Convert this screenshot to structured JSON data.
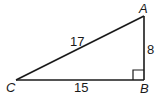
{
  "diagram": {
    "type": "right-triangle",
    "vertices": {
      "A": {
        "label": "A"
      },
      "B": {
        "label": "B"
      },
      "C": {
        "label": "C"
      }
    },
    "sides": {
      "hypotenuse_CA": "17",
      "leg_AB": "8",
      "leg_CB": "15"
    },
    "right_angle_at": "B",
    "stroke_color": "#1a1a1a"
  }
}
